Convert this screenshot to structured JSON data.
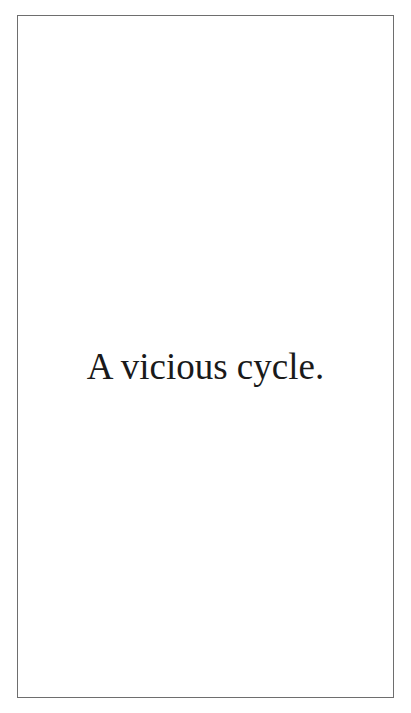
{
  "page": {
    "text": "A vicious cycle.",
    "border_color": "#6e6e6e",
    "text_color": "#1a1a1a",
    "background": "#ffffff"
  }
}
